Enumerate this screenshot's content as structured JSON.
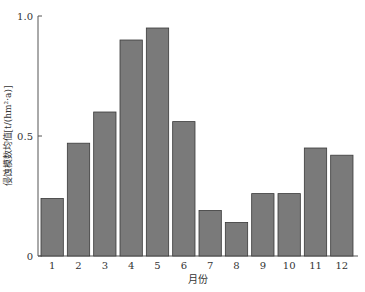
{
  "chart_data": {
    "type": "bar",
    "title": "",
    "xlabel": "月份",
    "ylabel": "侵蚀模数均值[t/(hm²·a)]",
    "categories": [
      "1",
      "2",
      "3",
      "4",
      "5",
      "6",
      "7",
      "8",
      "9",
      "10",
      "11",
      "12"
    ],
    "values": [
      0.24,
      0.47,
      0.6,
      0.9,
      0.95,
      0.56,
      0.19,
      0.14,
      0.26,
      0.26,
      0.45,
      0.42
    ],
    "ylim": [
      0,
      1.0
    ],
    "yticks": [
      0,
      0.5,
      1.0
    ],
    "ytick_labels": [
      "0",
      "0.5",
      "1.0"
    ],
    "grid": false,
    "legend": null,
    "bar_color": "#7a7a7a",
    "bar_edge_color": "#3a3a3a"
  }
}
